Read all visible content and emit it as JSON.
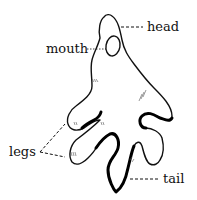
{
  "diagram": {
    "labels": {
      "head": "head",
      "mouth": "mouth",
      "legs": "legs",
      "tail": "tail"
    }
  }
}
